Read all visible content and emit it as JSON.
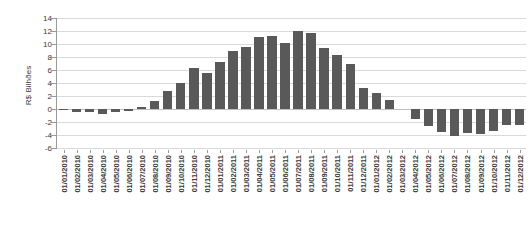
{
  "chart_data": {
    "type": "bar",
    "title": "",
    "subtitle": "",
    "xlabel": "",
    "ylabel": "R$ Bilhões",
    "ylim": [
      -6,
      14
    ],
    "ytick_step": 2,
    "yticks": [
      14,
      12,
      10,
      8,
      6,
      4,
      2,
      0,
      -2,
      -4,
      -6
    ],
    "ytick_labels": [
      "14",
      "12",
      "10",
      "8",
      "6",
      "4",
      "2",
      "0",
      "-2",
      "-4",
      "-6"
    ],
    "grid": true,
    "grid_axis": "y",
    "legend": false,
    "legend_position": "none",
    "bar_color": "#595959",
    "categories": [
      "01/01/2010",
      "01/02/2010",
      "01/03/2010",
      "01/04/2010",
      "01/05/2010",
      "01/06/2010",
      "01/07/2010",
      "01/08/2010",
      "01/09/2010",
      "01/10/2010",
      "01/11/2010",
      "01/12/2010",
      "01/01/2011",
      "01/02/2011",
      "01/03/2011",
      "01/04/2011",
      "01/05/2011",
      "01/06/2011",
      "01/07/2011",
      "01/08/2011",
      "01/09/2011",
      "01/10/2011",
      "01/11/2011",
      "01/12/2011",
      "01/01/2012",
      "01/02/2012",
      "01/03/2012",
      "01/04/2012",
      "01/05/2012",
      "01/06/2012",
      "01/07/2012",
      "01/08/2012",
      "01/09/2012",
      "01/10/2012",
      "01/11/2012",
      "01/12/2012"
    ],
    "values": [
      -0.2,
      -0.4,
      -0.5,
      -0.75,
      -0.5,
      -0.35,
      0.25,
      1.25,
      2.7,
      4.0,
      6.25,
      5.5,
      7.2,
      8.9,
      9.6,
      11.1,
      11.2,
      10.1,
      12.0,
      11.75,
      9.35,
      8.35,
      6.9,
      3.25,
      2.4,
      1.45,
      0.0,
      -1.5,
      -2.6,
      -3.5,
      -4.2,
      -3.7,
      -3.8,
      -3.35,
      -2.5,
      -2.5
    ]
  }
}
